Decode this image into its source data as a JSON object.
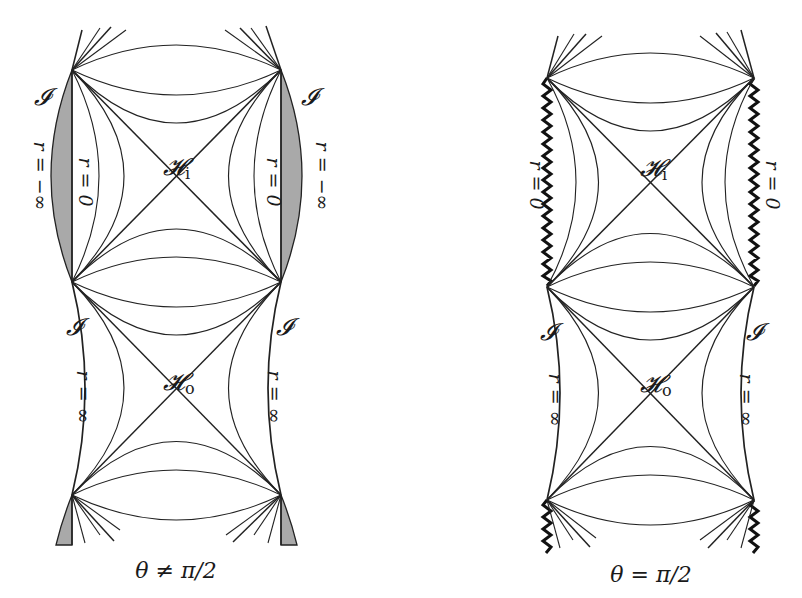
{
  "figure": {
    "type": "penrose-diagrams",
    "panels": [
      {
        "id": "left",
        "caption": "θ ≠ π/2",
        "horizon_inner": {
          "base": "𝓗",
          "sub": "i"
        },
        "horizon_outer": {
          "base": "𝓗",
          "sub": "o"
        },
        "scri_label": "𝓘",
        "labels": {
          "r_neg_inf_left": "r = −∞",
          "r_zero_left": "r = 0",
          "r_zero_right": "r = 0",
          "r_neg_inf_right": "r = −∞",
          "r_inf_left": "r = ∞",
          "r_inf_right": "r = ∞"
        },
        "shaded_region_color": "#a9a9a9",
        "boundary": "regular (timelike r=0, continues to r=−∞)"
      },
      {
        "id": "right",
        "caption": "θ = π/2",
        "horizon_inner": {
          "base": "𝓗",
          "sub": "i"
        },
        "horizon_outer": {
          "base": "𝓗",
          "sub": "o"
        },
        "scri_label": "𝓘",
        "labels": {
          "r_zero_left": "r = 0",
          "r_zero_right": "r = 0",
          "r_inf_left": "r = ∞",
          "r_inf_right": "r = ∞"
        },
        "boundary": "singular (zig-zag r=0)"
      }
    ]
  }
}
